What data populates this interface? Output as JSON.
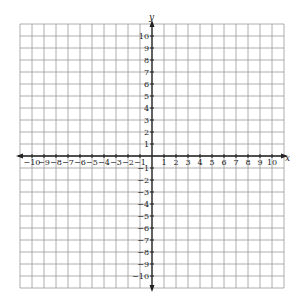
{
  "chart_data": {
    "type": "scatter",
    "title": "",
    "xlabel": "x",
    "ylabel": "y",
    "xlim": [
      -11,
      11
    ],
    "ylim": [
      -11,
      11
    ],
    "grid": true,
    "x_ticks": [
      -10,
      -9,
      -8,
      -7,
      -6,
      -5,
      -4,
      -3,
      -2,
      -1,
      1,
      2,
      3,
      4,
      5,
      6,
      7,
      8,
      9,
      10
    ],
    "y_ticks": [
      10,
      9,
      8,
      7,
      6,
      5,
      4,
      3,
      2,
      1,
      -1,
      -2,
      -3,
      -4,
      -5,
      -6,
      -7,
      -8,
      -9,
      -10
    ],
    "x_tick_labels": [
      "−10",
      "−9",
      "−8",
      "−7",
      "−6",
      "−5",
      "−4",
      "−3",
      "−2",
      "−1",
      "1",
      "2",
      "3",
      "4",
      "5",
      "6",
      "7",
      "8",
      "9",
      "10"
    ],
    "y_tick_labels": [
      "10",
      "9",
      "8",
      "7",
      "6",
      "5",
      "4",
      "3",
      "2",
      "1",
      "−1",
      "−2",
      "−3",
      "−4",
      "−5",
      "−6",
      "−7",
      "−8",
      "−9",
      "−10"
    ],
    "series": [],
    "legend": null
  },
  "colors": {
    "grid": "#9a9a9a",
    "axis": "#222222",
    "background": "#ffffff"
  }
}
